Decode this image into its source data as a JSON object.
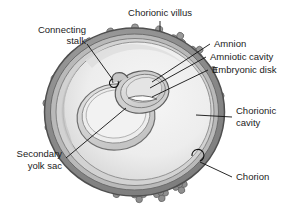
{
  "figure": {
    "background_color": "#ffffff"
  },
  "labels": {
    "chorionic_villus": "Chorionic villus",
    "connecting_stalk_line1": "Connecting",
    "connecting_stalk_line2": "stalk",
    "amnion": "Amnion",
    "amniotic_cavity": "Amniotic cavity",
    "embryonic_disk": "Embryonic disk",
    "chorionic_cavity_line1": "Chorionic",
    "chorionic_cavity_line2": "cavity",
    "secondary_yolk_sac_line1": "Secondary",
    "secondary_yolk_sac_line2": "yolk sac",
    "chorion": "Chorion"
  },
  "colors": {
    "outline": "#4a4a4a",
    "chorion_ring": "#8c8c8c",
    "chorion_ring_dark": "#6f6f6f",
    "villus": "#9a9a9a",
    "villus_dark": "#7d7d7d",
    "chorionic_cavity_fill": "#efefef",
    "inner_shadow": "#c9c9c9",
    "yolk_sac_fill": "#d8d8d8",
    "amnion_fill": "#dcdcdc",
    "embryonic_disk_fill": "#fbfbfb",
    "placenta_band": "#9b9b9b",
    "text": "#1b1b1b",
    "leader_line": "#111111"
  },
  "structures": [
    {
      "name": "chorion",
      "description": "outer layered wall of the vesicle"
    },
    {
      "name": "chorionic-villus",
      "description": "cloverleaf projections on the outer wall"
    },
    {
      "name": "chorionic-cavity",
      "description": "large pale interior space"
    },
    {
      "name": "connecting-stalk",
      "description": "stalk joining amnion to chorion wall"
    },
    {
      "name": "amnion",
      "description": "membrane enclosing the amniotic cavity"
    },
    {
      "name": "amniotic-cavity",
      "description": "small sac above the embryonic disk"
    },
    {
      "name": "embryonic-disk",
      "description": "pale sliver between amnion and yolk sac"
    },
    {
      "name": "secondary-yolk-sac",
      "description": "large ring below the embryonic disk"
    }
  ]
}
